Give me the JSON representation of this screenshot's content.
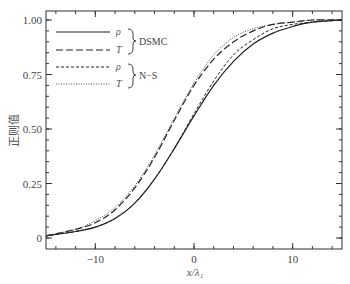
{
  "chart_data": {
    "type": "line",
    "title": "",
    "xlabel": "x/λ₁",
    "ylabel": "正则值",
    "xlim": [
      -15,
      15
    ],
    "ylim": [
      -0.03,
      1.03
    ],
    "grid": false,
    "legend_position": "upper left",
    "x_ticks": [
      -10,
      0,
      10
    ],
    "x_tick_labels": [
      "−10",
      "0",
      "10"
    ],
    "y_ticks": [
      0,
      0.25,
      0.5,
      0.75,
      1.0
    ],
    "y_tick_labels": [
      "0",
      "0.25",
      "0.50",
      "0.75",
      "1.00"
    ],
    "legend_groups": [
      {
        "group": "DSMC",
        "entries": [
          {
            "symbol": "ρ",
            "style": "solid"
          },
          {
            "symbol": "T",
            "style": "long-dash"
          }
        ]
      },
      {
        "group": "N−S",
        "entries": [
          {
            "symbol": "ρ",
            "style": "short-dash"
          },
          {
            "symbol": "T",
            "style": "dotted"
          }
        ]
      }
    ],
    "x": [
      -15,
      -12,
      -10,
      -8,
      -6,
      -4,
      -2,
      0,
      2,
      4,
      6,
      8,
      10,
      12,
      15
    ],
    "series": [
      {
        "name": "DSMC ρ",
        "style": "solid",
        "values": [
          0.01,
          0.03,
          0.05,
          0.09,
          0.16,
          0.27,
          0.41,
          0.56,
          0.7,
          0.81,
          0.89,
          0.94,
          0.97,
          0.99,
          1.0
        ]
      },
      {
        "name": "DSMC T",
        "style": "long-dash",
        "values": [
          0.01,
          0.04,
          0.07,
          0.13,
          0.23,
          0.37,
          0.54,
          0.7,
          0.82,
          0.9,
          0.95,
          0.98,
          0.99,
          1.0,
          1.0
        ]
      },
      {
        "name": "N−S ρ",
        "style": "short-dash",
        "values": [
          0.01,
          0.03,
          0.05,
          0.09,
          0.16,
          0.27,
          0.41,
          0.57,
          0.72,
          0.84,
          0.91,
          0.96,
          0.98,
          0.99,
          1.0
        ]
      },
      {
        "name": "N−S T",
        "style": "dotted",
        "values": [
          0.01,
          0.04,
          0.08,
          0.14,
          0.24,
          0.38,
          0.55,
          0.71,
          0.84,
          0.92,
          0.96,
          0.98,
          0.99,
          1.0,
          1.0
        ]
      }
    ]
  },
  "labels": {
    "xlabel": "x/λ₁",
    "ylabel": "正则值",
    "legend_dsmc": "DSMC",
    "legend_ns": "N−S",
    "rho": "ρ",
    "temp": "T"
  }
}
